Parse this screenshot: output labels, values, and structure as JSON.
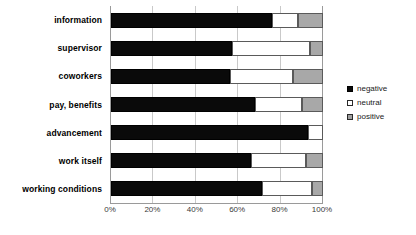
{
  "chart_data": {
    "type": "bar",
    "orientation": "horizontal",
    "stacked": true,
    "stack_total_percent": 100,
    "title": "",
    "xlabel": "",
    "ylabel": "",
    "xlim": [
      0,
      100
    ],
    "xtick_labels": [
      "0%",
      "20%",
      "40%",
      "60%",
      "80%",
      "100%"
    ],
    "xtick_values": [
      0,
      20,
      40,
      60,
      80,
      100
    ],
    "grid": true,
    "grid_axis": "x",
    "legend_position": "right",
    "categories": [
      "information",
      "supervisor",
      "coworkers",
      "pay, benefits",
      "advancement",
      "work itself",
      "working conditions"
    ],
    "series": [
      {
        "name": "negative",
        "key_style": "filled-black",
        "values": [
          76,
          57,
          56,
          68,
          93,
          66,
          71
        ]
      },
      {
        "name": "neutral",
        "key_style": "white-dotted",
        "values": [
          12,
          37,
          30,
          22,
          7,
          26,
          24
        ]
      },
      {
        "name": "positive",
        "key_style": "gray",
        "values": [
          12,
          6,
          14,
          10,
          0,
          8,
          5
        ]
      }
    ]
  },
  "legend": {
    "items": [
      {
        "label": "negative"
      },
      {
        "label": "neutral"
      },
      {
        "label": "positive"
      }
    ]
  },
  "colors": {
    "negative": "#0a0a0a",
    "neutral": "#ffffff",
    "positive": "#a8a8a8",
    "gridline": "#c9c9c9",
    "axis": "#9a9a9a",
    "text": "#000000"
  }
}
